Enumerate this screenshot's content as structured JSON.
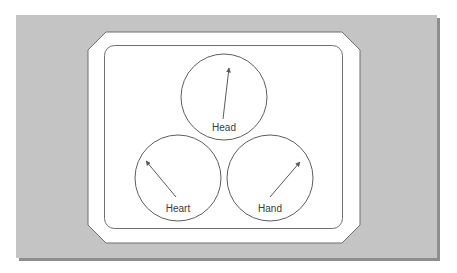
{
  "colors": {
    "background": "#ffffff",
    "panel": "#c4c4c4",
    "panel_shadow": "#8e8e8e",
    "frame_fill": "#ffffff",
    "frame_stroke": "#6f6f6f",
    "dial_stroke": "#5e5e5e",
    "needle": "#5a5a5a",
    "label_text": "#3a3a3a"
  },
  "diagram": {
    "dials": [
      {
        "id": "head",
        "label": "Head",
        "cx": 224,
        "cy": 97,
        "r": 43,
        "needle": {
          "x1": 223,
          "y1": 119,
          "x2": 229,
          "y2": 68
        }
      },
      {
        "id": "heart",
        "label": "Heart",
        "cx": 178,
        "cy": 178,
        "r": 43,
        "needle": {
          "x1": 176,
          "y1": 197,
          "x2": 146,
          "y2": 161
        }
      },
      {
        "id": "hand",
        "label": "Hand",
        "cx": 270,
        "cy": 178,
        "r": 43,
        "needle": {
          "x1": 270,
          "y1": 197,
          "x2": 300,
          "y2": 162
        }
      }
    ]
  }
}
